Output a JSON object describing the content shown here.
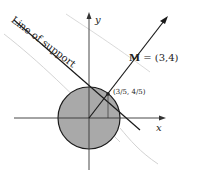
{
  "diagram": {
    "labels": {
      "line_of_support": "Line of support",
      "vector_name": "M",
      "vector_value": " = (3,4)",
      "tangent_point": "(3/5, 4/5)",
      "x_axis": "x",
      "y_axis": "y"
    },
    "colors": {
      "disk_fill": "#a9a9a9",
      "stroke": "#1a1a1a",
      "background": "#ffffff",
      "faint_marks": "#c8c8c8"
    },
    "geometry": {
      "origin": [
        89,
        118
      ],
      "radius": 31,
      "tangent_point_px": [
        108,
        94
      ],
      "vector_tip_px": [
        168,
        16
      ]
    }
  }
}
